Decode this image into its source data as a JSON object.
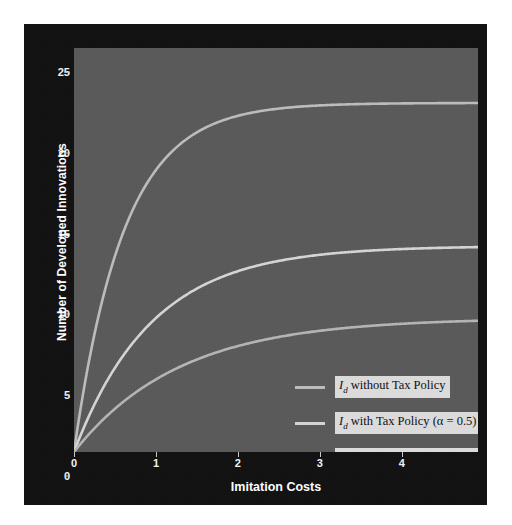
{
  "chart_data": {
    "type": "line",
    "title": "",
    "xlabel": "Imitation Costs",
    "ylabel": "Number of Developed Innovations",
    "xlim": [
      0,
      4.93
    ],
    "ylim": [
      0,
      25
    ],
    "xticks": [
      0,
      1,
      2,
      3,
      4
    ],
    "yticks": [
      0,
      5,
      10,
      15,
      20,
      25
    ],
    "grid": false,
    "legend_position": "lower right",
    "background": "#5a5a5a",
    "figure_background": "#121212",
    "series": [
      {
        "name": "I_d without Tax Policy",
        "legend_label": "I_d without  Tax Policy",
        "color": "#bdbdbd",
        "asymptote": 21.6,
        "rate": 1.65,
        "x": [
          0,
          0.1,
          0.2,
          0.3,
          0.4,
          0.5,
          0.7,
          0.9,
          1.2,
          1.5,
          2.0,
          2.5,
          3.0,
          3.5,
          4.0,
          4.5,
          4.93
        ],
        "y": [
          0,
          3.29,
          6.07,
          8.43,
          10.43,
          12.12,
          14.79,
          16.71,
          18.63,
          19.79,
          20.81,
          21.23,
          21.41,
          21.5,
          21.54,
          21.57,
          21.58
        ]
      },
      {
        "name": "I_d with Tax Policy (alpha = 0.5)",
        "legend_label": "I_d with Tax Policy (α = 0.5)",
        "color": "#d5d5d5",
        "asymptote": 12.75,
        "rate": 1.05,
        "x": [
          0,
          0.1,
          0.2,
          0.3,
          0.5,
          0.7,
          1.0,
          1.3,
          1.7,
          2.1,
          2.6,
          3.1,
          3.6,
          4.1,
          4.6,
          4.93
        ],
        "y": [
          0,
          1.27,
          2.41,
          3.45,
          5.22,
          6.65,
          8.29,
          9.49,
          10.64,
          11.34,
          11.93,
          12.25,
          12.44,
          12.55,
          12.61,
          12.64
        ]
      },
      {
        "name": "I_d with Tax Policy (alpha = 0.8)",
        "legend_label": "I_d with Tax Policy (α = 0.8)",
        "color": "#b5b5b5",
        "asymptote": 8.3,
        "rate": 0.78,
        "x": [
          0,
          0.15,
          0.3,
          0.5,
          0.8,
          1.1,
          1.5,
          2.0,
          2.5,
          3.0,
          3.5,
          4.0,
          4.5,
          4.93
        ],
        "y": [
          0,
          0.91,
          1.73,
          2.7,
          3.86,
          4.78,
          5.73,
          6.57,
          7.13,
          7.51,
          7.77,
          7.94,
          8.06,
          8.13
        ]
      }
    ]
  },
  "axes": {
    "y_tick_labels": [
      "25",
      "20",
      "15",
      "10",
      "5",
      "0"
    ],
    "x_tick_labels": [
      "0",
      "1",
      "2",
      "3",
      "4"
    ],
    "y_title": "Number of Developed Innovations",
    "x_title": "Imitation Costs"
  },
  "legend": {
    "items": [
      {
        "symbol": "I",
        "subscript": "d",
        "rest": " without  Tax Policy",
        "swatch_color": "#bdbdbd"
      },
      {
        "symbol": "I",
        "subscript": "d",
        "rest": " with Tax Policy (α = 0.5)",
        "swatch_color": "#d5d5d5"
      },
      {
        "symbol": "I",
        "subscript": "d",
        "rest": " with Tax Policy (α = 0.8)",
        "swatch_color": "#b5b5b5"
      }
    ]
  },
  "scan_artifact": {
    "text": ""
  }
}
